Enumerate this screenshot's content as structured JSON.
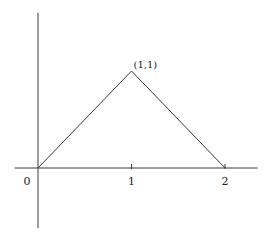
{
  "chart_data": {
    "type": "line",
    "title": "",
    "xlabel": "",
    "ylabel": "",
    "xlim": [
      -0.25,
      2.35
    ],
    "ylim": [
      -0.62,
      1.6
    ],
    "grid": false,
    "legend": "none",
    "series": [
      {
        "name": "triangle",
        "x": [
          0,
          1,
          2
        ],
        "y": [
          0,
          1,
          0
        ]
      }
    ],
    "x_tick_labels": [
      {
        "value": 0,
        "label": "0"
      },
      {
        "value": 1,
        "label": "1"
      },
      {
        "value": 2,
        "label": "2"
      }
    ],
    "annotations": [
      {
        "x": 1,
        "y": 1,
        "text": "(1,1)"
      }
    ],
    "colors": {
      "line": "#3a3a3a",
      "axis": "#3a3a3a",
      "text": "#222222"
    }
  }
}
